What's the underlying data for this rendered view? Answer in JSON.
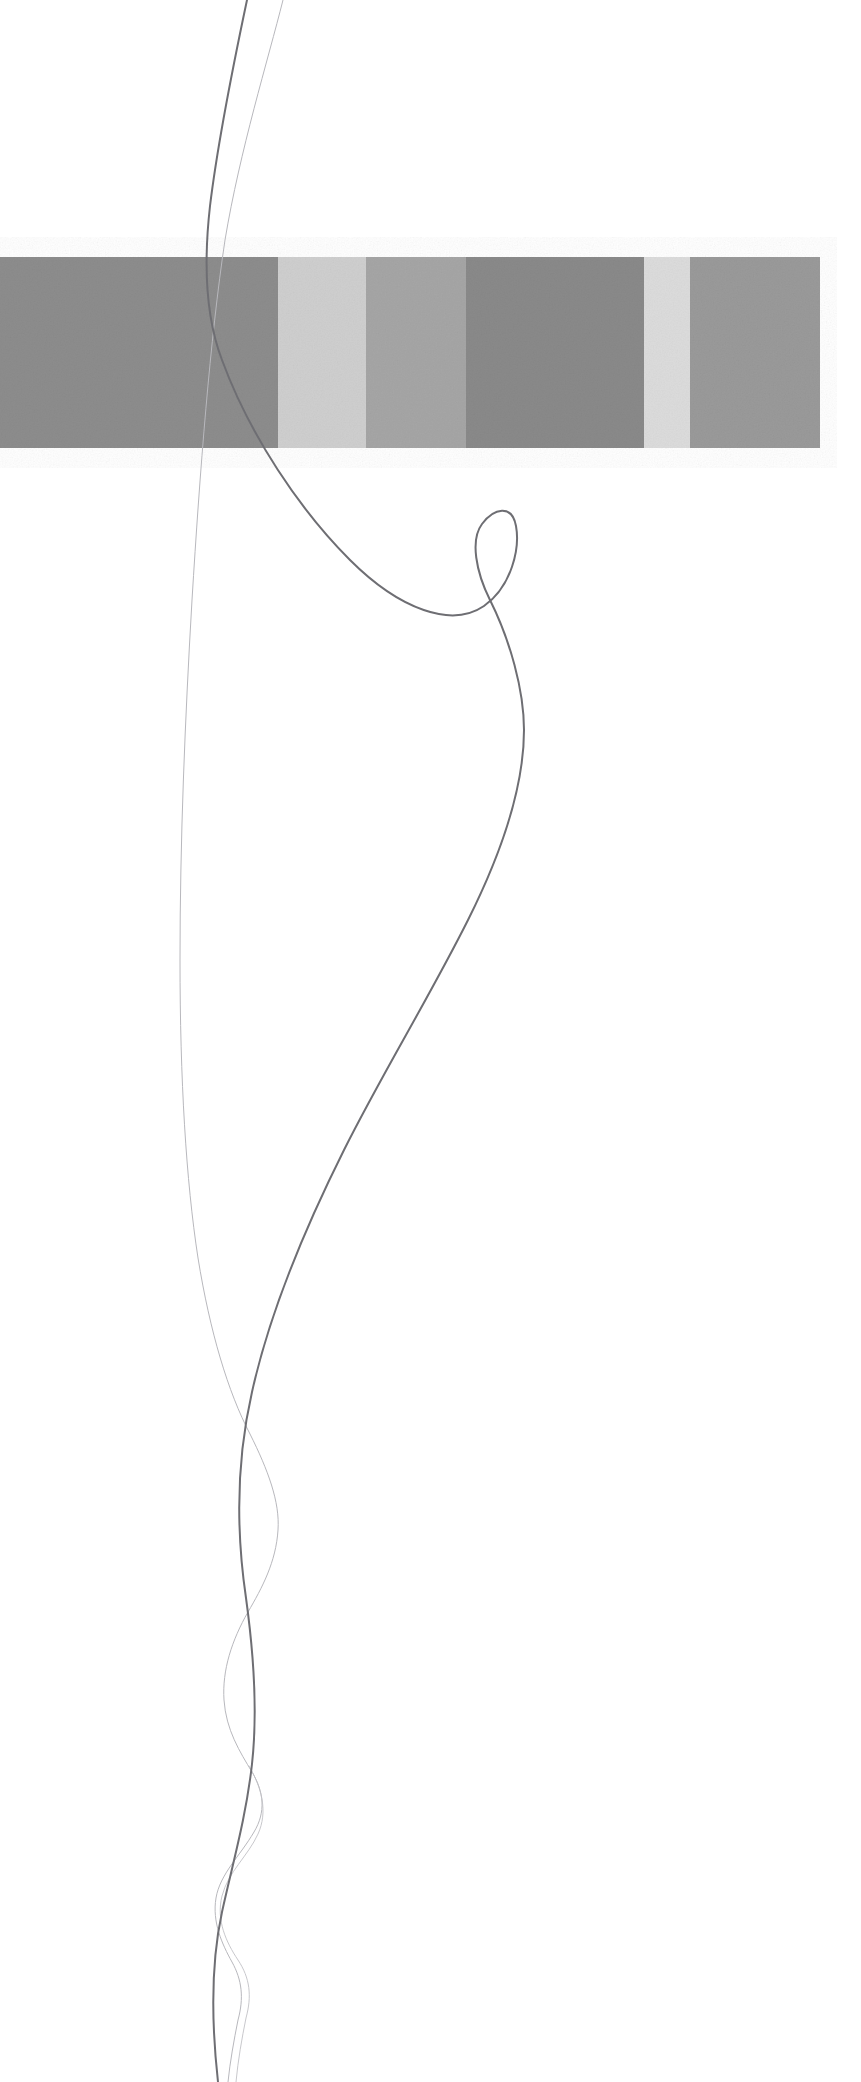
{
  "artwork": {
    "title": "Abstract line drawing with horizontal grayscale stripe band",
    "background_color": "#ffffff",
    "canvas": {
      "width": 861,
      "height": 2082
    }
  },
  "band": {
    "name": "grayscale-stripe-band",
    "x": 0,
    "y": 257,
    "width": 820,
    "height": 191,
    "orientation": "horizontal",
    "noise": "fine film grain texture",
    "stripes": [
      {
        "label": "stripe-1",
        "x": 0,
        "width": 278,
        "color": "#8d8d8d"
      },
      {
        "label": "stripe-2",
        "x": 278,
        "width": 88,
        "color": "#cfcfcf"
      },
      {
        "label": "stripe-3",
        "x": 366,
        "width": 100,
        "color": "#a6a6a6"
      },
      {
        "label": "stripe-4",
        "x": 466,
        "width": 178,
        "color": "#8a8a8a"
      },
      {
        "label": "stripe-5",
        "x": 644,
        "width": 46,
        "color": "#dcdcdc"
      },
      {
        "label": "stripe-6",
        "x": 690,
        "width": 130,
        "color": "#9a9a9a"
      }
    ]
  },
  "curves": [
    {
      "label": "primary-curve",
      "description": "Dark thin pencil line entering top, sweeping right into a small loop, descending in a long S then running to the bottom edge",
      "stroke_color": "#6e6e73",
      "stroke_width": 2.0,
      "path": "M 247 0 C 236 52 218 140 210 206 C 203 268 206 318 222 360 C 250 436 300 510 350 560 C 400 610 452 628 484 606 C 512 586 520 548 516 526 C 512 504 494 508 482 524 C 470 540 476 572 490 600 C 510 640 524 690 524 730 C 524 790 500 856 468 920 C 430 996 382 1074 344 1150 C 300 1238 268 1320 252 1392 C 236 1462 236 1530 246 1598 C 254 1656 258 1710 252 1764 C 246 1818 232 1866 222 1912 C 212 1958 210 2010 218 2082"
    },
    {
      "label": "secondary-curve",
      "description": "Very faint hair-thin line entering top right of the primary, falling almost vertically, crossing the primary near the bottom and weaving through it",
      "stroke_color": "#b8b8bd",
      "stroke_width": 1.0,
      "path": "M 283 0 C 268 60 240 150 225 240 C 210 340 200 470 192 600 C 185 720 180 840 180 960 C 180 1080 186 1180 198 1258 C 210 1332 228 1392 250 1434 C 268 1470 280 1502 278 1530 C 276 1562 262 1588 248 1612 C 232 1640 222 1670 224 1700 C 226 1730 240 1752 252 1772 C 264 1792 266 1812 254 1832 C 240 1856 220 1874 216 1898 C 212 1922 222 1944 232 1962 C 242 1980 244 1998 238 2020 C 234 2040 230 2062 228 2082"
    },
    {
      "label": "tertiary-curve",
      "description": "Faint secondary hairline looping around the bottom tangle",
      "stroke_color": "#c2c2c6",
      "stroke_width": 0.9,
      "path": "M 249 1766 C 262 1788 268 1812 258 1834 C 248 1856 228 1872 222 1896 C 216 1920 226 1942 238 1960 C 250 1978 252 1996 246 2018 C 242 2038 238 2060 236 2082"
    }
  ]
}
